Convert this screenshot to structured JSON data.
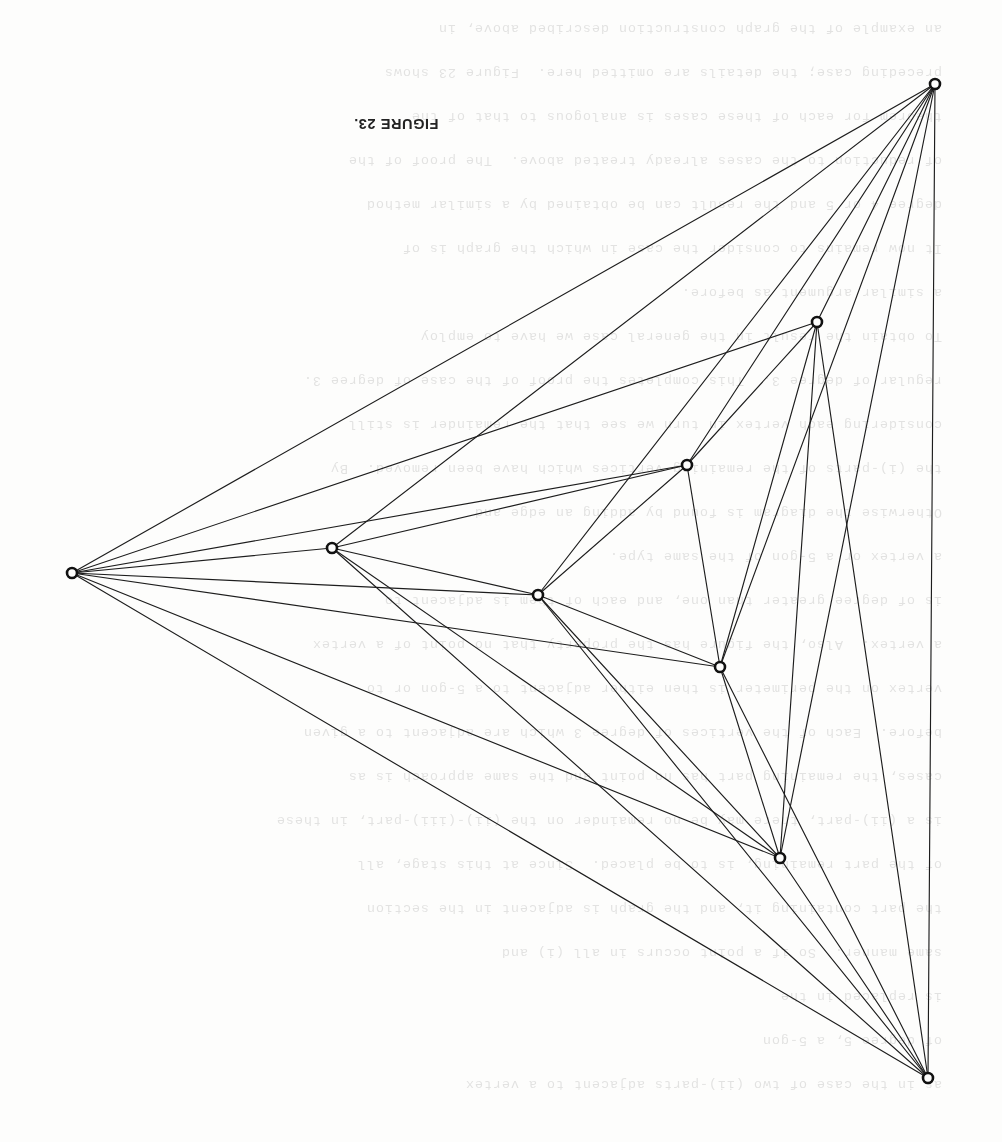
{
  "page": {
    "width": 1002,
    "height": 1142,
    "background_color": "#fdfdfc",
    "ink_color": "#1d1d1d"
  },
  "caption": {
    "text": "FIGURE 23.",
    "rotation_degrees": 180,
    "x": 335,
    "y": 116
  },
  "bleed_through_text": {
    "note": "faint mirrored show-through from the reverse side of the scanned page",
    "opacity": 0.16,
    "rotation_degrees": 180,
    "lines": [
      {
        "top": 36,
        "text": "as in the case of two (ii)-parts adjacent to a vertex"
      },
      {
        "top": 80,
        "text": "of degree 5, a 5-gon"
      },
      {
        "top": 124,
        "text": "is replaced in the"
      },
      {
        "top": 168,
        "text": "same manner.  So if a point occurs in all (i) and"
      },
      {
        "top": 212,
        "text": "the part containing it, and the graph is adjacent in the section"
      },
      {
        "top": 256,
        "text": "of the part remaining, is to be placed.  Since at this stage, all"
      },
      {
        "top": 300,
        "text": "is a (ii)-part, there may be no remainder on the (ii)-(iii)-part, in these"
      },
      {
        "top": 344,
        "text": "cases, the remaining part has no point and the same approach is as"
      },
      {
        "top": 388,
        "text": "before.  Each of the vertices of degree 3 which are adjacent to a given"
      },
      {
        "top": 432,
        "text": "vertex on the perimeter is then either adjacent to a 5-gon or to"
      },
      {
        "top": 476,
        "text": "a vertex.  Also, the figure has the property that no point of a vertex"
      },
      {
        "top": 520,
        "text": "is of degree greater than one, and each of them is adjacent to"
      },
      {
        "top": 564,
        "text": "a vertex or a 5-gon of the same type."
      },
      {
        "top": 608,
        "text": "Otherwise the diagram is found by adding an edge and"
      },
      {
        "top": 652,
        "text": "the (i)-parts of the remaining vertices which have been removed.  By"
      },
      {
        "top": 696,
        "text": "considering each vertex in turn we see that the remainder is still"
      },
      {
        "top": 740,
        "text": "regular of degree 3.  This completes the proof of the case of degree 3."
      },
      {
        "top": 784,
        "text": "To obtain the result in the general case we have to employ"
      },
      {
        "top": 828,
        "text": "a similar argument as before."
      },
      {
        "top": 872,
        "text": "It now remains to consider the case in which the graph is of"
      },
      {
        "top": 916,
        "text": "degree 4 or 5 and the result can be obtained by a similar method"
      },
      {
        "top": 960,
        "text": "of reduction to the cases already treated above.  The proof of the"
      },
      {
        "top": 1004,
        "text": "theorem for each of these cases is analogous to that of the"
      },
      {
        "top": 1048,
        "text": "preceding case; the details are omitted here.  Figure 23 shows"
      },
      {
        "top": 1092,
        "text": "an example of the graph construction described above, in"
      }
    ]
  },
  "figure": {
    "type": "graph-drawing",
    "title": "FIGURE 23.",
    "vertex_count": 8,
    "edge_count": 24,
    "vertex_radius": 5,
    "vertices": [
      {
        "id": "v0",
        "label": "top-right-outer",
        "x": 935,
        "y": 84
      },
      {
        "id": "v1",
        "label": "left-outer",
        "x": 72,
        "y": 573
      },
      {
        "id": "v2",
        "label": "bottom-right-outer",
        "x": 928,
        "y": 1078
      },
      {
        "id": "v3",
        "label": "upper-right-inner",
        "x": 817,
        "y": 322
      },
      {
        "id": "v4",
        "label": "upper-middle-inner",
        "x": 687,
        "y": 465
      },
      {
        "id": "v5",
        "label": "left-middle-inner",
        "x": 332,
        "y": 548
      },
      {
        "id": "v6",
        "label": "center-inner",
        "x": 538,
        "y": 595
      },
      {
        "id": "v7",
        "label": "center-right-inner",
        "x": 720,
        "y": 667
      },
      {
        "id": "v8",
        "label": "lower-center-inner",
        "x": 780,
        "y": 858
      }
    ],
    "edges": [
      {
        "from": "v0",
        "to": "v1"
      },
      {
        "from": "v0",
        "to": "v2"
      },
      {
        "from": "v0",
        "to": "v3"
      },
      {
        "from": "v0",
        "to": "v4"
      },
      {
        "from": "v0",
        "to": "v5"
      },
      {
        "from": "v0",
        "to": "v6"
      },
      {
        "from": "v0",
        "to": "v7"
      },
      {
        "from": "v0",
        "to": "v8"
      },
      {
        "from": "v1",
        "to": "v2"
      },
      {
        "from": "v1",
        "to": "v3"
      },
      {
        "from": "v1",
        "to": "v4"
      },
      {
        "from": "v1",
        "to": "v5"
      },
      {
        "from": "v1",
        "to": "v6"
      },
      {
        "from": "v1",
        "to": "v7"
      },
      {
        "from": "v1",
        "to": "v8"
      },
      {
        "from": "v2",
        "to": "v3"
      },
      {
        "from": "v2",
        "to": "v5"
      },
      {
        "from": "v2",
        "to": "v6"
      },
      {
        "from": "v2",
        "to": "v7"
      },
      {
        "from": "v2",
        "to": "v8"
      },
      {
        "from": "v3",
        "to": "v4"
      },
      {
        "from": "v3",
        "to": "v7"
      },
      {
        "from": "v3",
        "to": "v8"
      },
      {
        "from": "v4",
        "to": "v5"
      },
      {
        "from": "v4",
        "to": "v6"
      },
      {
        "from": "v4",
        "to": "v7"
      },
      {
        "from": "v5",
        "to": "v6"
      },
      {
        "from": "v5",
        "to": "v8"
      },
      {
        "from": "v6",
        "to": "v7"
      },
      {
        "from": "v6",
        "to": "v8"
      },
      {
        "from": "v7",
        "to": "v8"
      }
    ]
  }
}
